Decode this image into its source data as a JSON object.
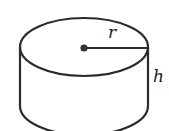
{
  "diagram": {
    "type": "cylinder",
    "labels": {
      "radius": "r",
      "height": "h"
    },
    "colors": {
      "stroke": "#2b2b2b",
      "background": "#ffffff",
      "center_dot": "#333333"
    }
  }
}
